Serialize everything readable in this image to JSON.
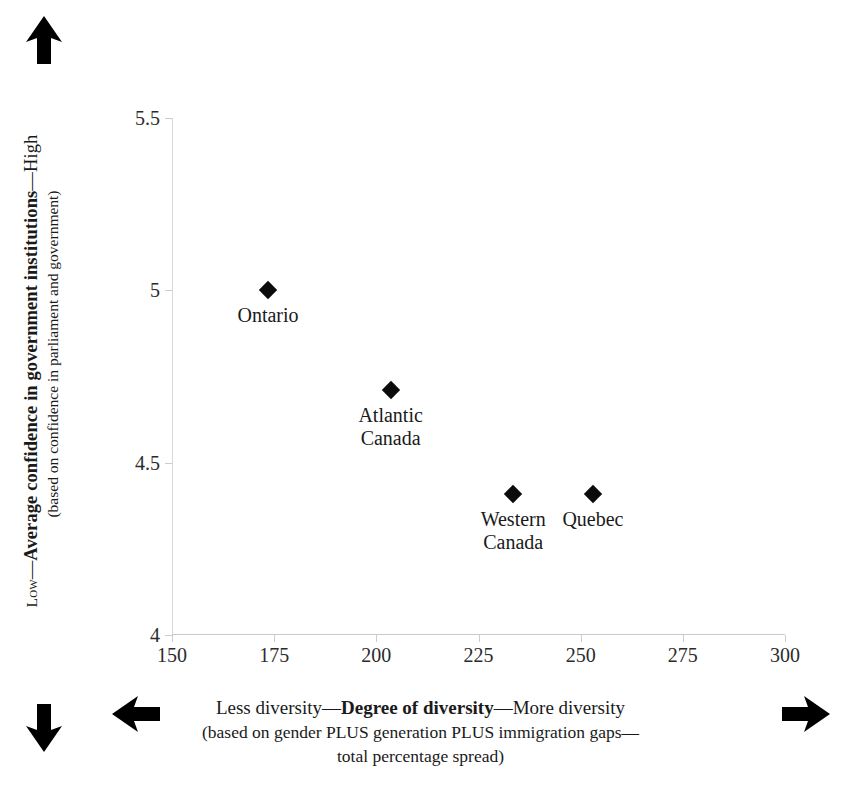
{
  "chart_data": {
    "type": "scatter",
    "title": "",
    "xlabel": "Degree of diversity",
    "ylabel": "Average confidence in government institutions",
    "xlim": [
      150,
      300
    ],
    "ylim": [
      4,
      5.5
    ],
    "grid": false,
    "legend": "none",
    "x_ticks": [
      "150",
      "175",
      "200",
      "225",
      "250",
      "275",
      "300"
    ],
    "y_ticks": [
      "5.5",
      "5",
      "4.5",
      "4"
    ],
    "points": [
      {
        "label": "Ontario",
        "label_lines": [
          "Ontario"
        ],
        "x": 173.5,
        "y": 5.0
      },
      {
        "label": "Atlantic Canada",
        "label_lines": [
          "Atlantic",
          "Canada"
        ],
        "x": 203.5,
        "y": 4.71
      },
      {
        "label": "Western Canada",
        "label_lines": [
          "Western",
          "Canada"
        ],
        "x": 233.5,
        "y": 4.41
      },
      {
        "label": "Quebec",
        "label_lines": [
          "Quebec"
        ],
        "x": 253.0,
        "y": 4.41
      }
    ]
  },
  "y_axis": {
    "low_word": "Low",
    "dash_after_low": "—",
    "bold_text": "Average confidence in government institutions",
    "dash_before_high": "—",
    "high_word": "High",
    "sub_caption": "(based on confidence in parliament and government)"
  },
  "x_axis": {
    "less_text": "Less diversity",
    "dash_after_less": "—",
    "bold_text": "Degree of diversity",
    "dash_before_more": "—",
    "more_text": "More diversity",
    "sub_caption_line1": "(based on gender PLUS generation PLUS immigration gaps—",
    "sub_caption_line2": "total percentage spread)"
  },
  "arrows": {
    "up": "arrow-up-icon",
    "down": "arrow-down-icon",
    "left": "arrow-left-icon",
    "right": "arrow-right-icon"
  },
  "colors": {
    "marker": "#0b0b0b",
    "axis": "#cccccc",
    "text": "#1a1a1a",
    "background": "#ffffff"
  }
}
